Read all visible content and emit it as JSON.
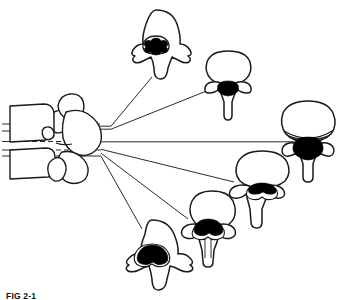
{
  "figure": {
    "caption_label": "FIG 2-1",
    "caption_text": "",
    "stroke_color": "#1a1a1a",
    "fill_color": "#ffffff",
    "cord_color": "#000000",
    "leader_color": "#2b2b2b",
    "background_color": "#ffffff"
  },
  "spine_lateral": {
    "name": "lateral-vertebral-column",
    "description": "Lateral (side) view of two stacked vertebrae with posterior elements",
    "position": {
      "x": 8,
      "y": 93,
      "width": 98,
      "height": 95
    },
    "section_lines": [
      {
        "id": "section-line-1",
        "y": 124,
        "x_start": 2,
        "x_end": 112,
        "dashed_from": 24,
        "dashed_to": 76
      },
      {
        "id": "section-line-2",
        "y": 131,
        "x_start": 2,
        "x_end": 112,
        "dashed_from": 24,
        "dashed_to": 76
      },
      {
        "id": "section-line-3",
        "y": 142,
        "x_start": 2,
        "x_end": 112,
        "dashed_from": 24,
        "dashed_to": 76
      },
      {
        "id": "section-line-4",
        "y": 150,
        "x_start": 2,
        "x_end": 112,
        "dashed_from": 24,
        "dashed_to": 76
      },
      {
        "id": "section-line-5",
        "y": 156,
        "x_start": 2,
        "x_end": 112,
        "dashed_from": 24,
        "dashed_to": 76
      }
    ]
  },
  "leader_lines": [
    {
      "id": "leader-to-cervical-upper",
      "from": {
        "x": 99,
        "y": 127
      },
      "to": {
        "x": 152,
        "y": 77
      }
    },
    {
      "id": "leader-to-thoracic-upper",
      "from": {
        "x": 99,
        "y": 128
      },
      "to": {
        "x": 213,
        "y": 88
      }
    },
    {
      "id": "leader-to-thoracic-right",
      "from": {
        "x": 101,
        "y": 142
      },
      "to": {
        "x": 292,
        "y": 142
      }
    },
    {
      "id": "leader-to-thoracolumbar",
      "from": {
        "x": 101,
        "y": 150
      },
      "to": {
        "x": 232,
        "y": 181
      }
    },
    {
      "id": "leader-to-lumbar-mid",
      "from": {
        "x": 101,
        "y": 153
      },
      "to": {
        "x": 186,
        "y": 218
      }
    },
    {
      "id": "leader-to-lumbar-lower",
      "from": {
        "x": 101,
        "y": 156
      },
      "to": {
        "x": 141,
        "y": 228
      }
    }
  ],
  "cross_sections": [
    {
      "id": "section-cervical",
      "name": "cervical-vertebra-cross-section",
      "order": 1,
      "position": {
        "x": 120,
        "y": 8,
        "width": 75,
        "height": 72
      },
      "body_shape": "broad-dome",
      "canal_shape": "triangular-rounded",
      "cord_visible": true,
      "cord_shape": "rounded-lobed",
      "shaded_disc": false
    },
    {
      "id": "section-upper-thoracic",
      "name": "upper-thoracic-vertebra-cross-section",
      "order": 2,
      "position": {
        "x": 198,
        "y": 48,
        "width": 62,
        "height": 72
      },
      "body_shape": "oval-heart",
      "canal_shape": "small-rounded",
      "cord_visible": true,
      "cord_shape": "rounded-oval",
      "shaded_disc": false
    },
    {
      "id": "section-mid-thoracic",
      "name": "mid-thoracic-vertebra-cross-section",
      "order": 3,
      "position": {
        "x": 278,
        "y": 98,
        "width": 60,
        "height": 80
      },
      "body_shape": "large-round",
      "canal_shape": "rounded",
      "cord_visible": true,
      "cord_shape": "broad-rounded",
      "shaded_disc": true
    },
    {
      "id": "section-lower-thoracic",
      "name": "lower-thoracic-vertebra-cross-section",
      "order": 4,
      "position": {
        "x": 228,
        "y": 148,
        "width": 68,
        "height": 76
      },
      "body_shape": "wide-oval",
      "canal_shape": "triangular",
      "cord_visible": true,
      "cord_shape": "triangular-wing",
      "shaded_disc": false
    },
    {
      "id": "section-thoracolumbar",
      "name": "thoracolumbar-vertebra-cross-section",
      "order": 5,
      "position": {
        "x": 180,
        "y": 188,
        "width": 64,
        "height": 78
      },
      "body_shape": "kidney-oval",
      "canal_shape": "triangular",
      "cord_visible": true,
      "cord_shape": "triangular-conus",
      "shaded_disc": false
    },
    {
      "id": "section-lumbar",
      "name": "lumbar-vertebra-cross-section",
      "order": 6,
      "position": {
        "x": 110,
        "y": 218,
        "width": 82,
        "height": 72
      },
      "body_shape": "broad-kidney",
      "canal_shape": "large-triangular",
      "cord_visible": true,
      "cord_shape": "triangular-cauda",
      "shaded_disc": false
    }
  ]
}
